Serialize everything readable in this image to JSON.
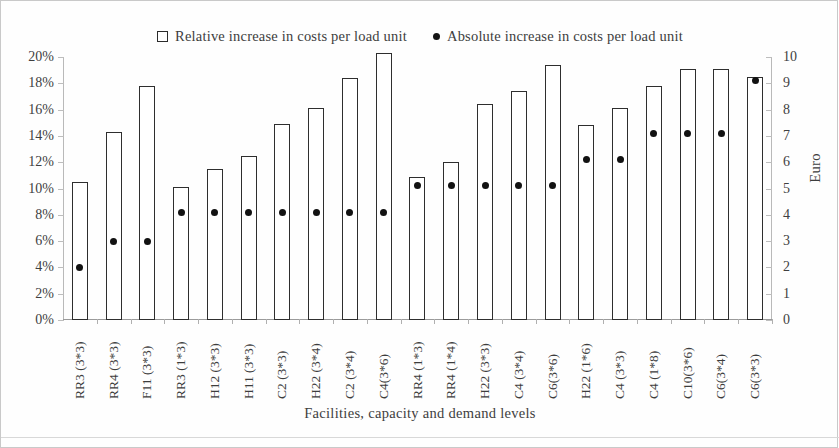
{
  "legend": {
    "items": [
      {
        "marker": "square-marker",
        "label": "Relative increase in costs per load unit"
      },
      {
        "marker": "dot-marker",
        "label": "Absolute increase in costs per load unit"
      }
    ]
  },
  "axes": {
    "left_title": "",
    "right_title": "Euro",
    "x_title": "Facilities, capacity and demand levels",
    "left_ticks": [
      "0%",
      "2%",
      "4%",
      "6%",
      "8%",
      "10%",
      "12%",
      "14%",
      "16%",
      "18%",
      "20%"
    ],
    "right_ticks": [
      "0",
      "1",
      "2",
      "3",
      "4",
      "5",
      "6",
      "7",
      "8",
      "9",
      "10"
    ]
  },
  "chart_data": {
    "type": "bar",
    "title": "",
    "xlabel": "Facilities, capacity and demand levels",
    "ylabel": "",
    "ylabel_right": "Euro",
    "ylim": [
      0,
      20
    ],
    "ylim_right": [
      0,
      10
    ],
    "grid": false,
    "legend_position": "top-center",
    "categories": [
      "RR3 (3*3)",
      "RR4 (3*3)",
      "F11 (3*3)",
      "RR3 (1*3)",
      "H12 (3*3)",
      "H11 (3*3)",
      "C2 (3*3)",
      "H22 (3*4)",
      "C2 (3*4)",
      "C4(3*6)",
      "RR4 (1*3)",
      "RR4 (1*4)",
      "H22 (3*3)",
      "C4 (3*4)",
      "C6(3*6)",
      "H22 (1*6)",
      "C4 (3*3)",
      "C4 (1*8)",
      "C10(3*6)",
      "C6(3*4)",
      "C6(3*3)"
    ],
    "series": [
      {
        "name": "Relative increase in costs per load unit",
        "type": "bar",
        "axis": "left",
        "unit": "%",
        "values": [
          10.5,
          14.3,
          17.8,
          10.1,
          11.5,
          12.5,
          14.9,
          16.1,
          18.4,
          20.3,
          10.9,
          12.0,
          16.4,
          17.4,
          19.4,
          14.8,
          16.1,
          17.8,
          19.1,
          19.1,
          18.5
        ]
      },
      {
        "name": "Absolute increase in costs per load unit",
        "type": "scatter",
        "axis": "right",
        "unit": "Euro",
        "values": [
          2.0,
          3.0,
          3.0,
          4.1,
          4.1,
          4.1,
          4.1,
          4.1,
          4.1,
          4.1,
          5.1,
          5.1,
          5.1,
          5.1,
          5.1,
          6.1,
          6.1,
          7.1,
          7.1,
          7.1,
          9.1
        ]
      }
    ]
  }
}
